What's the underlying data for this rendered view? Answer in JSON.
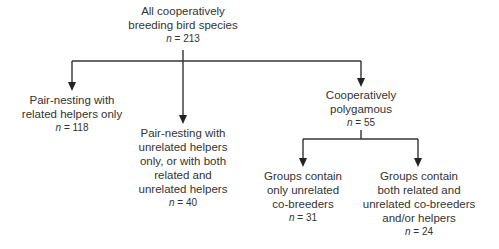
{
  "diagram": {
    "root": {
      "lines": [
        "All cooperatively",
        "breeding bird species"
      ],
      "n_label": "n",
      "n_value": "= 213"
    },
    "pair_related": {
      "lines": [
        "Pair-nesting with",
        "related helpers only"
      ],
      "n_label": "n",
      "n_value": "= 118"
    },
    "pair_unrelated": {
      "lines": [
        "Pair-nesting with",
        "unrelated helpers",
        "only, or with both",
        "related and",
        "unrelated helpers"
      ],
      "n_label": "n",
      "n_value": "= 40"
    },
    "polygamous": {
      "lines": [
        "Cooperatively",
        "polygamous"
      ],
      "n_label": "n",
      "n_value": "= 55"
    },
    "groups_unrelated": {
      "lines": [
        "Groups contain",
        "only unrelated",
        "co-breeders"
      ],
      "n_label": "n",
      "n_value": "= 31"
    },
    "groups_both": {
      "lines": [
        "Groups contain",
        "both related and",
        "unrelated co-breeders",
        "and/or helpers"
      ],
      "n_label": "n",
      "n_value": "= 24"
    },
    "line_color": "#333333"
  }
}
